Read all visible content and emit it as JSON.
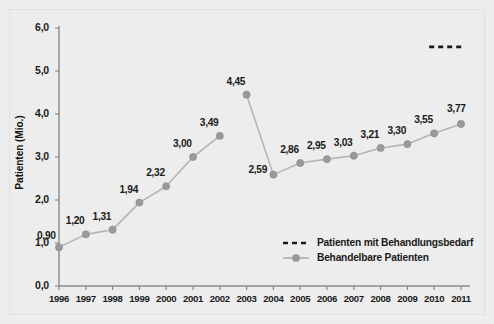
{
  "chart_data": {
    "type": "line",
    "title": "",
    "xlabel": "",
    "ylabel": "Patienten (Mio.)",
    "ylim": [
      0,
      6
    ],
    "yticks": [
      "0,0",
      "1,0",
      "2,0",
      "3,0",
      "4,0",
      "5,0",
      "6,0"
    ],
    "ytick_values": [
      0,
      1,
      2,
      3,
      4,
      5,
      6
    ],
    "categories": [
      "1996",
      "1997",
      "1998",
      "1999",
      "2000",
      "2001",
      "2002",
      "2003",
      "2004",
      "2005",
      "2006",
      "2007",
      "2008",
      "2009",
      "2010",
      "2011"
    ],
    "grid": false,
    "legend_position": "bottom-right",
    "series": [
      {
        "name": "Patienten mit Behandlungsbedarf",
        "style": "dashed",
        "color": "#1a1a1a",
        "values": [
          null,
          null,
          null,
          null,
          null,
          null,
          null,
          null,
          null,
          null,
          null,
          null,
          null,
          null,
          5.56,
          5.56
        ],
        "labels": []
      },
      {
        "name": "Behandelbare Patienten",
        "style": "line-marker",
        "color": "#9a9a9a",
        "values": [
          0.9,
          1.2,
          1.31,
          1.94,
          2.32,
          3.0,
          3.49,
          4.45,
          2.59,
          2.86,
          2.95,
          3.03,
          3.21,
          3.3,
          3.55,
          3.77
        ],
        "labels": [
          "0,90",
          "1,20",
          "1,31",
          "1,94",
          "2,32",
          "3,00",
          "3,49",
          "4,45",
          "2,59",
          "2,86",
          "2,95",
          "3,03",
          "3,21",
          "3,30",
          "3,55",
          "3,77"
        ],
        "break_after_index": 6
      }
    ],
    "legend": [
      {
        "label": "Patienten mit Behandlungsbedarf",
        "marker": "dashed-line",
        "color": "#1a1a1a"
      },
      {
        "label": "Behandelbare Patienten",
        "marker": "line-with-dot",
        "color": "#9a9a9a"
      }
    ],
    "colors": {
      "background": "#ededed",
      "axis": "#8a8a8a",
      "marker": "#9a9a9a",
      "line": "#b5b5b5",
      "dashed": "#1a1a1a",
      "text": "#1a1a1a"
    }
  }
}
